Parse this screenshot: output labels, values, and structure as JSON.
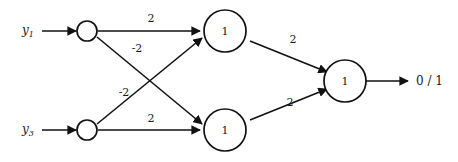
{
  "diagram": {
    "inputs": [
      {
        "id": "y1",
        "base": "y",
        "sub": "1"
      },
      {
        "id": "y3",
        "base": "y",
        "sub": "3"
      }
    ],
    "input_nodes": [
      {
        "id": "in-top",
        "label": ""
      },
      {
        "id": "in-bottom",
        "label": ""
      }
    ],
    "hidden_nodes": [
      {
        "id": "hidden-top",
        "label": "1"
      },
      {
        "id": "hidden-bottom",
        "label": "1"
      }
    ],
    "output_node": {
      "id": "output",
      "label": "1"
    },
    "output_arrow_label": "0 / 1",
    "weights": {
      "in_top_to_hidden_top": "2",
      "in_top_to_hidden_bottom": "-2",
      "in_bottom_to_hidden_top": "-2",
      "in_bottom_to_hidden_bottom": "2",
      "hidden_top_to_output": "2",
      "hidden_bottom_to_output": "2"
    },
    "colors": {
      "stroke": "#111111",
      "text": "#1a1a1a",
      "background": "#ffffff"
    }
  }
}
